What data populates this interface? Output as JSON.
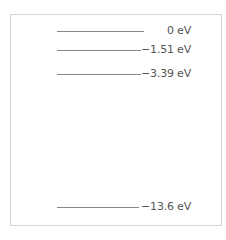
{
  "diagram": {
    "title": "",
    "levels": [
      {
        "energy": "0 eV",
        "value": 0
      },
      {
        "energy": "−1.51 eV",
        "value": -1.51
      },
      {
        "energy": "−3.39 eV",
        "value": -3.39
      },
      {
        "energy": "−13.6 eV",
        "value": -13.6
      }
    ],
    "colors": {
      "line": "#8a8a8a",
      "text": "#555555",
      "border": "#d6d6d6"
    }
  }
}
